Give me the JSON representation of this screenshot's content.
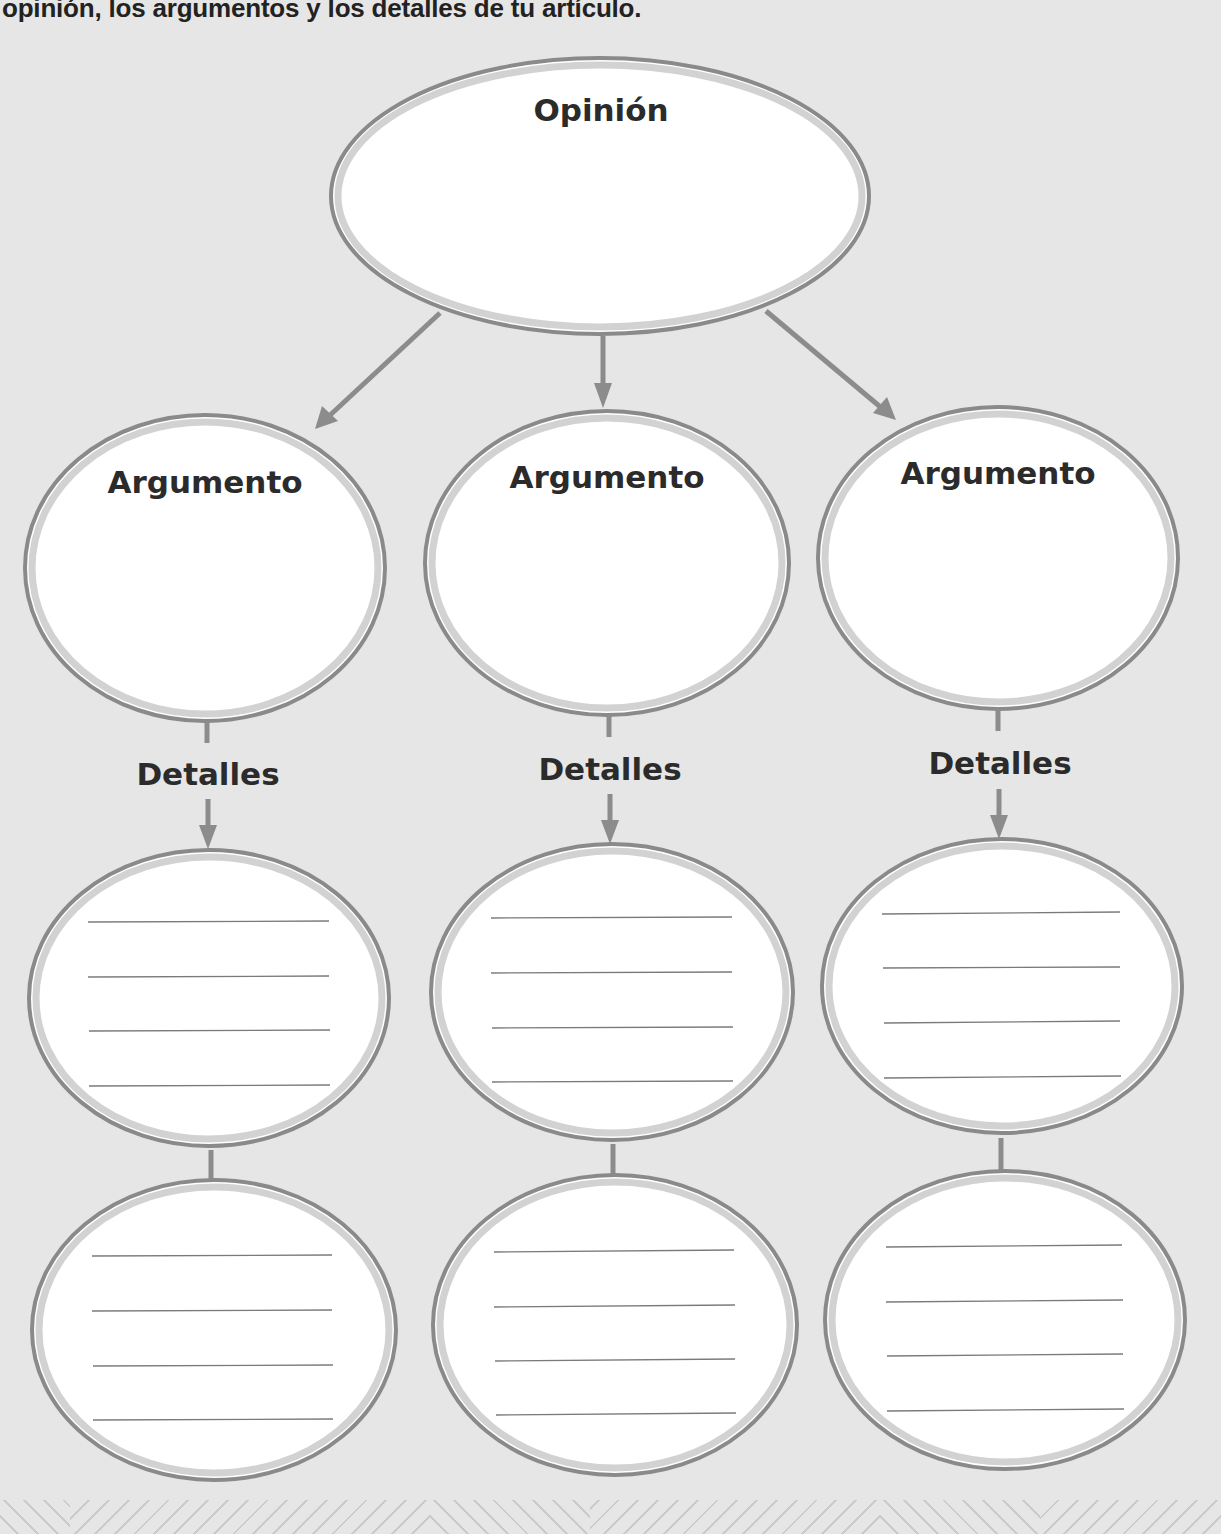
{
  "instruction": {
    "text": "opinión, los argumentos y los detalles de tu artículo."
  },
  "organizer": {
    "opinion": {
      "label": "Opinión"
    },
    "columns": [
      {
        "argument_label": "Argumento",
        "details_label": "Detalles",
        "detail_boxes": [
          {
            "lines": 4
          },
          {
            "lines": 4
          }
        ]
      },
      {
        "argument_label": "Argumento",
        "details_label": "Detalles",
        "detail_boxes": [
          {
            "lines": 4
          },
          {
            "lines": 4
          }
        ]
      },
      {
        "argument_label": "Argumento",
        "details_label": "Detalles",
        "detail_boxes": [
          {
            "lines": 4
          },
          {
            "lines": 4
          }
        ]
      }
    ]
  },
  "colors": {
    "background": "#e6e6e6",
    "ellipse_fill": "#ffffff",
    "ellipse_stroke": "#8a8a8a",
    "ellipse_inner_band": "#d2d2d2",
    "arrow": "#8c8c8c",
    "text": "#2b2b2b"
  }
}
